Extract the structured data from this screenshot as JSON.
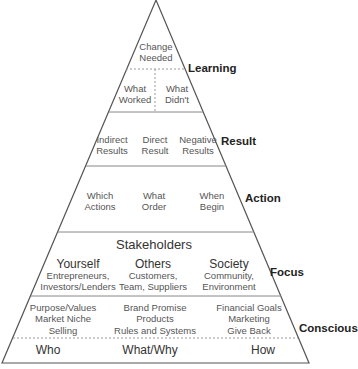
{
  "levels": {
    "learning": {
      "label": "Learning",
      "top": "Change\nNeeded",
      "left": "What\nWorked",
      "right": "What\nDidn't"
    },
    "result": {
      "label": "Result",
      "items": [
        "Indirect\nResults",
        "Direct\nResult",
        "Negative\nResults"
      ]
    },
    "action": {
      "label": "Action",
      "items": [
        "Which\nActions",
        "What\nOrder",
        "When\nBegin"
      ]
    },
    "focus": {
      "label": "Focus",
      "heading": "Stakeholders",
      "items": [
        {
          "title": "Yourself",
          "sub": "Entrepreneurs,\nInvestors/Lenders"
        },
        {
          "title": "Others",
          "sub": "Customers,\nTeam, Suppliers"
        },
        {
          "title": "Society",
          "sub": "Community,\nEnvironment"
        }
      ]
    },
    "conscious": {
      "label": "Conscious",
      "items": [
        "Purpose/Values\nMarket Niche\nSelling",
        "Brand Promise\nProducts\nRules and Systems",
        "Financial Goals\nMarketing\nGive Back"
      ],
      "footer": [
        "Who",
        "What/Why",
        "How"
      ]
    }
  },
  "colors": {
    "line": "#555555",
    "dotted": "#999999",
    "text": "#444444",
    "label": "#222222"
  }
}
